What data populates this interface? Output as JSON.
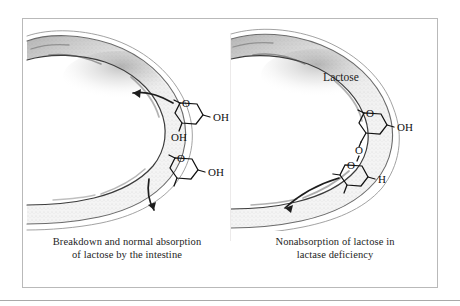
{
  "figure": {
    "type": "scientific-illustration",
    "background_color": "#ffffff",
    "frame_color": "#b9b9b9",
    "ink_color": "#1f1f1f"
  },
  "panels": [
    {
      "id": "left",
      "caption_line1": "Breakdown and normal absorption",
      "caption_line2": "of lactose by the intestine",
      "molecule_name": "",
      "molecules": [
        {
          "id": "monosaccharide-upper",
          "labels": [
            {
              "text": "O",
              "role": "ring-oxygen"
            },
            {
              "text": "OH",
              "role": "hydroxyl-right"
            },
            {
              "text": "OH",
              "role": "hydroxyl-lower-left"
            }
          ]
        },
        {
          "id": "monosaccharide-lower",
          "labels": [
            {
              "text": "O",
              "role": "ring-oxygen"
            },
            {
              "text": "OH",
              "role": "hydroxyl-right"
            }
          ]
        }
      ],
      "arrows": [
        {
          "id": "absorption-arrow-upper",
          "direction": "left-into-wall",
          "meaning": "sugar absorbed through intestinal wall"
        },
        {
          "id": "transit-arrow-lower",
          "direction": "down",
          "meaning": "sugar moving along lumen"
        }
      ]
    },
    {
      "id": "right",
      "caption_line1": "Nonabsorption of lactose in",
      "caption_line2": "lactase deficiency",
      "molecule_name": "Lactose",
      "molecules": [
        {
          "id": "lactose-disaccharide",
          "labels": [
            {
              "text": "O",
              "role": "ring-oxygen-upper"
            },
            {
              "text": "OH",
              "role": "hydroxyl-right"
            },
            {
              "text": "O",
              "role": "glycosidic-linkage"
            },
            {
              "text": "O",
              "role": "ring-oxygen-lower"
            },
            {
              "text": "H",
              "role": "hydrogen-lower-right"
            }
          ]
        }
      ],
      "arrows": [
        {
          "id": "passthrough-arrow",
          "direction": "down-left-along-lumen",
          "meaning": "undigested lactose passes through intestine"
        }
      ]
    }
  ]
}
